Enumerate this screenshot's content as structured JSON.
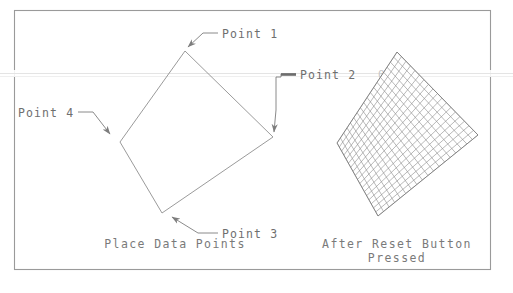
{
  "figure": {
    "frame": {
      "x": 14,
      "y": 10,
      "width": 476,
      "height": 259
    },
    "background_color": "#ffffff",
    "line_color": "#8a8a8a",
    "text_color": "#6f6f6f",
    "scan_artifact_color": "#e2e2e2"
  },
  "left_panel": {
    "caption": "Place Data Points",
    "caption_x": 175,
    "caption_y": 248,
    "shape": {
      "type": "quadrilateral",
      "vertices": [
        {
          "label": "Point 1",
          "x": 185,
          "y": 51
        },
        {
          "label": "Point 2",
          "x": 273,
          "y": 137
        },
        {
          "label": "Point 3",
          "x": 162,
          "y": 213
        },
        {
          "label": "Point 4",
          "x": 120,
          "y": 142
        }
      ]
    },
    "annotations": [
      {
        "label": "Point 1",
        "text_x": 222,
        "text_y": 38,
        "leader": "M 218 33 L 203 33 L 188 47",
        "arrow_at": {
          "x": 186,
          "y": 50
        },
        "arrow_angle": 137
      },
      {
        "label": "Point 2",
        "text_x": 300,
        "text_y": 79,
        "leader": "M 296 74 L 281 74 L 281 77 L 276 77 L 276 110 L 274 132",
        "arrow_at": {
          "x": 274,
          "y": 135
        },
        "arrow_angle": 95
      },
      {
        "label": "Point 4",
        "text_x": 18,
        "text_y": 117,
        "leader": "M 78 112 L 93 112 L 110 134",
        "arrow_at": {
          "x": 113,
          "y": 138
        },
        "arrow_angle": 52
      },
      {
        "label": "Point 3",
        "text_x": 222,
        "text_y": 238,
        "leader": "M 218 233 L 198 233 L 172 217",
        "arrow_at": {
          "x": 168,
          "y": 214
        },
        "arrow_angle": 212
      }
    ]
  },
  "right_panel": {
    "caption_line1": "After Reset Button",
    "caption_line2": "Pressed",
    "caption_x": 397,
    "caption_y1": 248,
    "caption_y2": 262,
    "shape": {
      "type": "meshed-quadrilateral",
      "vertices": [
        {
          "x": 397,
          "y": 52
        },
        {
          "x": 478,
          "y": 135
        },
        {
          "x": 378,
          "y": 216
        },
        {
          "x": 337,
          "y": 143
        }
      ],
      "mesh_divisions_u": 18,
      "mesh_divisions_v": 18
    }
  },
  "artifacts": {
    "scan_line_y": 74,
    "scan_line_label": "horizontal-scan-band",
    "obscured_fragment": "0000"
  }
}
